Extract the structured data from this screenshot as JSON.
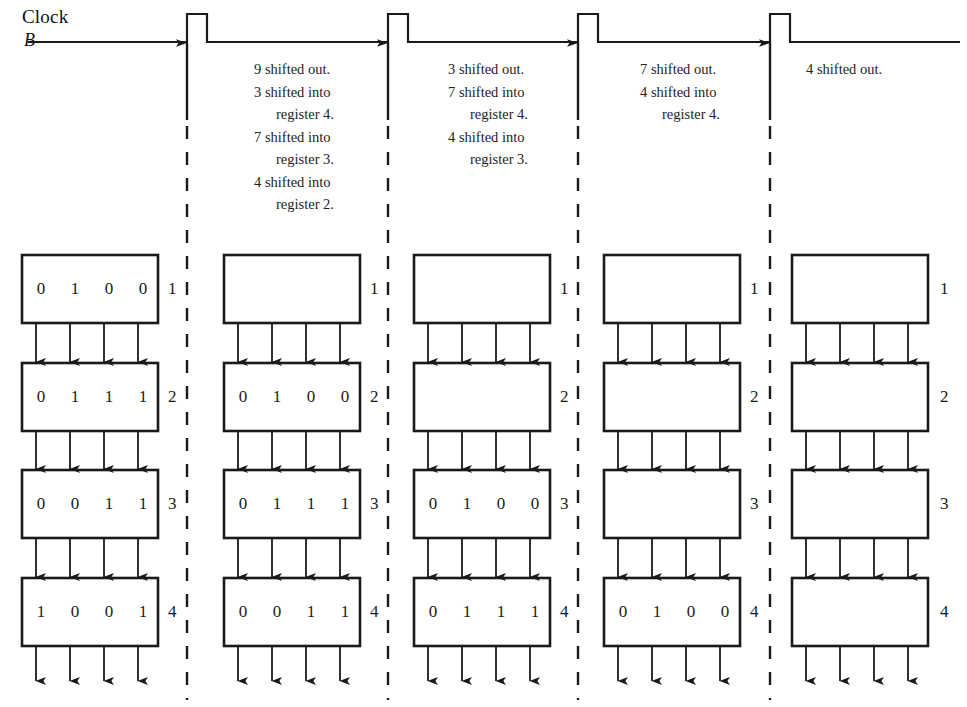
{
  "clock": {
    "label": "Clock",
    "sublabel": "B",
    "baseline_y": 42,
    "pulse_height": 28,
    "pulse_width": 20,
    "pulse_x": [
      187,
      388,
      578,
      770
    ]
  },
  "colors": {
    "ink": "#1a1a1a",
    "line": "#222222",
    "background": "#ffffff"
  },
  "notes": [
    {
      "x": 254,
      "y": 58,
      "lines": [
        {
          "text": "9 shifted out.",
          "indent": false
        },
        {
          "text": "3 shifted into",
          "indent": false
        },
        {
          "text": "register 4.",
          "indent": true
        },
        {
          "text": "7 shifted into",
          "indent": false
        },
        {
          "text": "register 3.",
          "indent": true
        },
        {
          "text": "4 shifted into",
          "indent": false
        },
        {
          "text": "register 2.",
          "indent": true
        }
      ]
    },
    {
      "x": 448,
      "y": 58,
      "lines": [
        {
          "text": "3 shifted out.",
          "indent": false
        },
        {
          "text": "7 shifted into",
          "indent": false
        },
        {
          "text": "register 4.",
          "indent": true
        },
        {
          "text": "4 shifted into",
          "indent": false
        },
        {
          "text": "register 3.",
          "indent": true
        }
      ]
    },
    {
      "x": 640,
      "y": 58,
      "lines": [
        {
          "text": "7 shifted out.",
          "indent": false
        },
        {
          "text": "4 shifted into",
          "indent": false
        },
        {
          "text": "register 4.",
          "indent": true
        }
      ]
    },
    {
      "x": 806,
      "y": 58,
      "lines": [
        {
          "text": "4 shifted out.",
          "indent": false
        }
      ]
    }
  ],
  "dividers": [
    {
      "x": 187
    },
    {
      "x": 388
    },
    {
      "x": 578
    },
    {
      "x": 770
    }
  ],
  "register_labels": [
    "1",
    "2",
    "3",
    "4"
  ],
  "columns": [
    {
      "name": "stage-1",
      "box_left": 22,
      "box_width": 136,
      "label_x": 168,
      "registers": [
        {
          "label": "1",
          "bits": [
            "0",
            "1",
            "0",
            "0"
          ]
        },
        {
          "label": "2",
          "bits": [
            "0",
            "1",
            "1",
            "1"
          ]
        },
        {
          "label": "3",
          "bits": [
            "0",
            "0",
            "1",
            "1"
          ]
        },
        {
          "label": "4",
          "bits": [
            "1",
            "0",
            "0",
            "1"
          ]
        }
      ]
    },
    {
      "name": "stage-2",
      "box_left": 224,
      "box_width": 136,
      "label_x": 370,
      "registers": [
        {
          "label": "1",
          "bits": []
        },
        {
          "label": "2",
          "bits": [
            "0",
            "1",
            "0",
            "0"
          ]
        },
        {
          "label": "3",
          "bits": [
            "0",
            "1",
            "1",
            "1"
          ]
        },
        {
          "label": "4",
          "bits": [
            "0",
            "0",
            "1",
            "1"
          ]
        }
      ]
    },
    {
      "name": "stage-3",
      "box_left": 414,
      "box_width": 136,
      "label_x": 560,
      "registers": [
        {
          "label": "1",
          "bits": []
        },
        {
          "label": "2",
          "bits": []
        },
        {
          "label": "3",
          "bits": [
            "0",
            "1",
            "0",
            "0"
          ]
        },
        {
          "label": "4",
          "bits": [
            "0",
            "1",
            "1",
            "1"
          ]
        }
      ]
    },
    {
      "name": "stage-4",
      "box_left": 604,
      "box_width": 136,
      "label_x": 750,
      "registers": [
        {
          "label": "1",
          "bits": []
        },
        {
          "label": "2",
          "bits": []
        },
        {
          "label": "3",
          "bits": []
        },
        {
          "label": "4",
          "bits": [
            "0",
            "1",
            "0",
            "0"
          ]
        }
      ]
    },
    {
      "name": "stage-5",
      "box_left": 792,
      "box_width": 136,
      "label_x": 940,
      "registers": [
        {
          "label": "1",
          "bits": []
        },
        {
          "label": "2",
          "bits": []
        },
        {
          "label": "3",
          "bits": []
        },
        {
          "label": "4",
          "bits": []
        }
      ]
    }
  ],
  "geometry": {
    "row_tops": [
      255,
      363,
      470,
      578
    ],
    "box_height": 68,
    "bit_offsets": [
      14,
      48,
      82,
      116
    ],
    "output_arrow_bottom": 682
  }
}
